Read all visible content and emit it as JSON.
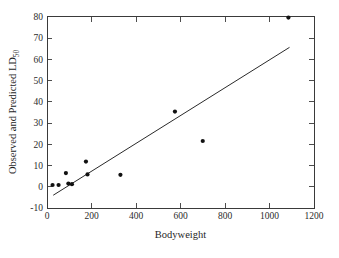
{
  "figure": {
    "background_color": "#ffffff",
    "foreground_color": "#1a1a1a",
    "point_color": "#111111",
    "line_color": "#2a2a2a"
  },
  "axes": {
    "x_title": "Bodyweight",
    "y_title_main": "Observed and Predicted LD",
    "y_title_subscript": "50",
    "x_ticks": [
      "0",
      "200",
      "400",
      "600",
      "800",
      "1000",
      "1200"
    ],
    "y_ticks": [
      "-10",
      "0",
      "10",
      "20",
      "30",
      "40",
      "50",
      "60",
      "70",
      "80"
    ]
  },
  "chart_data": {
    "type": "scatter",
    "title": "",
    "xlabel": "Bodyweight",
    "ylabel": "Observed and Predicted LD50",
    "xlim": [
      0,
      1200
    ],
    "ylim": [
      -10,
      80
    ],
    "xticks": [
      0,
      200,
      400,
      600,
      800,
      1000,
      1200
    ],
    "yticks": [
      -10,
      0,
      10,
      20,
      30,
      40,
      50,
      60,
      70,
      80
    ],
    "grid": false,
    "legend": false,
    "series": [
      {
        "name": "Observed LD50",
        "type": "scatter",
        "marker": "filled-circle",
        "color": "#111111",
        "points": [
          {
            "x": 25,
            "y": 0.8
          },
          {
            "x": 52,
            "y": 0.8
          },
          {
            "x": 85,
            "y": 6.4
          },
          {
            "x": 96,
            "y": 1.5
          },
          {
            "x": 112,
            "y": 1.2
          },
          {
            "x": 175,
            "y": 11.8
          },
          {
            "x": 182,
            "y": 5.8
          },
          {
            "x": 330,
            "y": 5.6
          },
          {
            "x": 575,
            "y": 35.3
          },
          {
            "x": 700,
            "y": 21.5
          },
          {
            "x": 1085,
            "y": 79.5
          }
        ]
      },
      {
        "name": "Predicted LD50 (fitted line)",
        "type": "line",
        "color": "#2a2a2a",
        "endpoints": [
          {
            "x": 28,
            "y": -4.0
          },
          {
            "x": 1090,
            "y": 65.5
          }
        ]
      }
    ]
  }
}
